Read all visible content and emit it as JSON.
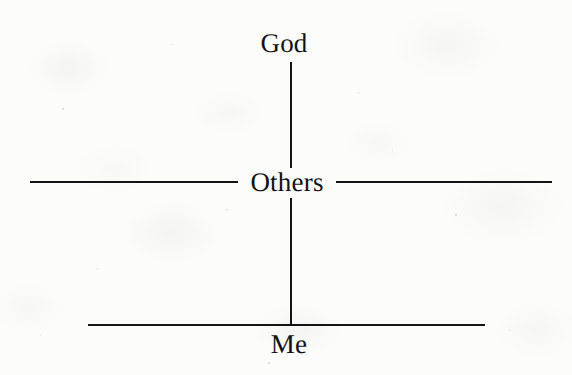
{
  "diagram": {
    "type": "hierarchy-priority-diagram",
    "title": "",
    "background_color": "#fcfcfb",
    "ink_color": "#141414",
    "nodes": [
      {
        "id": "god",
        "label": "God",
        "name": "node-god",
        "x": 284,
        "y": 30,
        "level": 1
      },
      {
        "id": "others",
        "label": "Others",
        "name": "node-others",
        "x": 287,
        "y": 169,
        "level": 2
      },
      {
        "id": "me",
        "label": "Me",
        "name": "node-me",
        "x": 289,
        "y": 331,
        "level": 3
      }
    ],
    "connectors": [
      {
        "id": "god-to-others",
        "name": "connector-god-others",
        "orientation": "vertical",
        "x": 290,
        "y1": 62,
        "y2": 168
      },
      {
        "id": "others-to-me",
        "name": "connector-others-me",
        "orientation": "vertical",
        "x": 290,
        "y1": 198,
        "y2": 326
      }
    ],
    "rules": [
      {
        "id": "others-rule-left",
        "name": "rule-others-left",
        "orientation": "horizontal",
        "x1": 30,
        "x2": 238,
        "y": 181
      },
      {
        "id": "others-rule-right",
        "name": "rule-others-right",
        "orientation": "horizontal",
        "x1": 336,
        "x2": 552,
        "y": 181
      },
      {
        "id": "me-rule",
        "name": "rule-me",
        "orientation": "horizontal",
        "x1": 88,
        "x2": 485,
        "y": 324
      }
    ]
  }
}
